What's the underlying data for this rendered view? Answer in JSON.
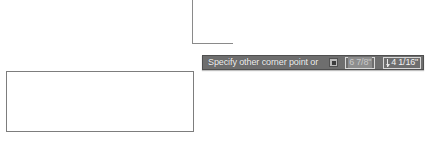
{
  "app": {
    "canvas_background": "#ffffff",
    "geometry_color": "#8a8a8a"
  },
  "drawing": {
    "rectangle_preview_name": "rectangle-preview",
    "crosshair_name": "crosshair-cursor"
  },
  "dynamic_input": {
    "prompt": "Specify other corner point or",
    "options_icon": "dropdown-square-icon",
    "background_color": "#6e6e6e",
    "border_color": "#4f4f4f",
    "text_color": "#f2f2f2",
    "fields": [
      {
        "name": "width-dimension",
        "value": "6 7/8\"",
        "state": "selected",
        "highlight_color": "#8d8d8d"
      },
      {
        "name": "height-dimension",
        "value": "4 1/16\"",
        "state": "normal",
        "marker_icon": "down-arrow-icon"
      }
    ]
  }
}
